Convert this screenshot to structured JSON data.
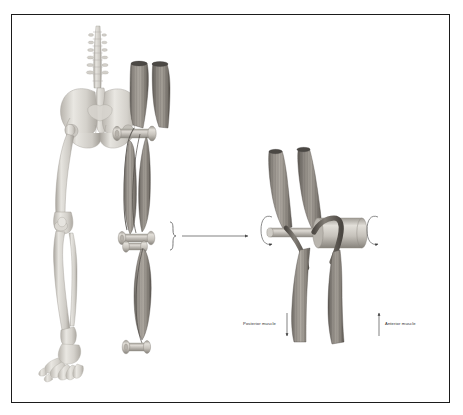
{
  "figure": {
    "domain": "anatomy-biomechanics-illustration",
    "style": "grayscale medical illustration on white, thin black rectangular border",
    "background_color": "#ffffff",
    "border_color": "#1b1b1b"
  },
  "labels": {
    "posterior": "Posterior muscle",
    "anterior": "Anterior muscle"
  },
  "colors": {
    "bone_light": "#e3e1dc",
    "bone_mid": "#c9c6c0",
    "bone_shadow": "#a8a49d",
    "muscle_light": "#b9b5ad",
    "muscle_mid": "#8d8881",
    "muscle_dark": "#5e5a55",
    "cylinder_light": "#dedbd5",
    "cylinder_mid": "#b5b1aa",
    "cylinder_dark": "#8a867f",
    "line": "#4a4a4a",
    "text": "#2b2b2b"
  },
  "panels": {
    "left": {
      "name": "skeleton-and-model",
      "parts": [
        "lumbar-spine",
        "pelvis",
        "femur",
        "tibia",
        "fibula",
        "patella",
        "foot-bones",
        "hip-spool",
        "knee-spool",
        "ankle-spool",
        "anterior-thigh-muscle",
        "posterior-thigh-muscle",
        "upper-muscle-cone-left",
        "upper-muscle-cone-right",
        "lower-leg-muscle"
      ]
    },
    "connector": {
      "name": "magnification-connector",
      "parts": [
        "curly-brace",
        "arrow-line",
        "arrow-head"
      ]
    },
    "right": {
      "name": "magnified-joint-detail",
      "parts": [
        "muscle-cone-left",
        "muscle-cone-right",
        "axle-shaft",
        "drum-cylinder",
        "tendon-band-anterior",
        "tendon-band-posterior",
        "rotation-arrow-left",
        "rotation-arrow-right",
        "posterior-arrow-down",
        "anterior-arrow-up"
      ]
    }
  },
  "annotations": {
    "posterior_arrow_direction": "down",
    "anterior_arrow_direction": "up",
    "rotation_arrows": 2
  }
}
